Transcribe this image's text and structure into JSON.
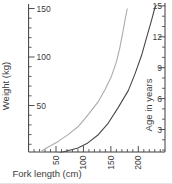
{
  "figure": {
    "background": "#ffffff",
    "edge_color": "#d9d9d9",
    "text_color": "#3c3c3c",
    "axis_color": "#3c3c3c"
  },
  "chart_data": {
    "type": "line",
    "title": "",
    "xlabel": "Fork length (cm)",
    "ylabel_left": "Weight (kg)",
    "ylabel_right": "Age in years",
    "grid": false,
    "legend": false,
    "x_axis": {
      "range": [
        0,
        249
      ],
      "major_ticks": [
        50,
        100,
        150,
        200
      ],
      "minor_step": 10,
      "tick_labels_rotated_90": true
    },
    "left_axis": {
      "range": [
        0,
        154
      ],
      "major_ticks": [
        50,
        100,
        150
      ],
      "minor_step": 10
    },
    "right_axis": {
      "range": [
        0.9,
        15.3
      ],
      "major_ticks": [
        3,
        6,
        9,
        12,
        15
      ],
      "minor_step": 1
    },
    "series": [
      {
        "name": "weight vs fork length",
        "axis": "left",
        "color": "#ababab",
        "points": [
          [
            15,
            0
          ],
          [
            35,
            7
          ],
          [
            54,
            13
          ],
          [
            72,
            20
          ],
          [
            90,
            28
          ],
          [
            108,
            40
          ],
          [
            127,
            54
          ],
          [
            139,
            66
          ],
          [
            151,
            80
          ],
          [
            160,
            95
          ],
          [
            166,
            109
          ],
          [
            172,
            126
          ],
          [
            177,
            142
          ],
          [
            180,
            150
          ]
        ]
      },
      {
        "name": "age vs fork length",
        "axis": "right",
        "color": "#474747",
        "points": [
          [
            40,
            0.4
          ],
          [
            54,
            0.7
          ],
          [
            90,
            1.2
          ],
          [
            108,
            1.7
          ],
          [
            127,
            2.5
          ],
          [
            145,
            3.6
          ],
          [
            163,
            5.1
          ],
          [
            182,
            6.8
          ],
          [
            194,
            8.4
          ],
          [
            206,
            10.2
          ],
          [
            215,
            11.9
          ],
          [
            224,
            13.6
          ],
          [
            230,
            14.8
          ],
          [
            233,
            15.1
          ]
        ]
      }
    ]
  }
}
